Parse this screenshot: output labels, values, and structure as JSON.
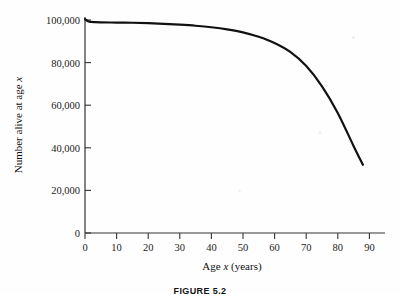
{
  "figure": {
    "caption": "FIGURE 5.2",
    "background_color": "#fefefe",
    "curve_color": "#111111",
    "axis_color": "#333333"
  },
  "axes": {
    "y_title_prefix": "Number alive at age ",
    "y_title_var": "x",
    "x_title_prefix": "Age ",
    "x_title_var": "x",
    "x_title_suffix": " (years)",
    "y_ticks": [
      "0",
      "20,000",
      "40,000",
      "60,000",
      "80,000",
      "100,000"
    ],
    "x_ticks": [
      "0",
      "10",
      "20",
      "30",
      "40",
      "50",
      "60",
      "70",
      "80",
      "90"
    ]
  },
  "chart_data": {
    "type": "line",
    "title": "FIGURE 5.2",
    "xlabel": "Age x (years)",
    "ylabel": "Number alive at age x",
    "xlim": [
      0,
      95
    ],
    "ylim": [
      0,
      105000
    ],
    "grid": false,
    "legend": false,
    "x_tick_values": [
      0,
      10,
      20,
      30,
      40,
      50,
      60,
      70,
      80,
      90
    ],
    "y_tick_values": [
      0,
      20000,
      40000,
      60000,
      80000,
      100000
    ],
    "series": [
      {
        "name": "Number alive at age x",
        "color": "#111111",
        "line_width": 2.2,
        "x": [
          0,
          1,
          2,
          3,
          5,
          10,
          15,
          20,
          25,
          30,
          35,
          40,
          45,
          50,
          55,
          60,
          65,
          70,
          75,
          80,
          85,
          88
        ],
        "values": [
          100400,
          99400,
          99100,
          99000,
          98900,
          98800,
          98700,
          98500,
          98200,
          97800,
          97300,
          96600,
          95600,
          94200,
          92100,
          89200,
          85000,
          78500,
          69000,
          56500,
          41000,
          32000
        ]
      }
    ],
    "annotations": []
  }
}
